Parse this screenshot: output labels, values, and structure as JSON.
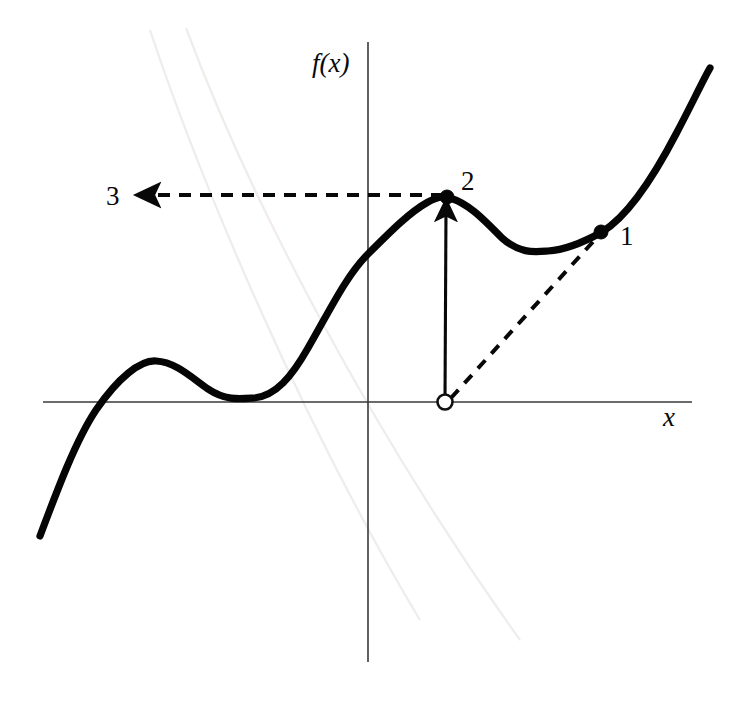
{
  "figure": {
    "background_color": "#ffffff",
    "curve_color": "#050505",
    "axis_color": "#3a3a3a",
    "label_color": "#0a0a0a"
  },
  "axes": {
    "y_axis_label": "f(x)",
    "x_axis_label": "x",
    "y_axis_label_pos": {
      "x": 312,
      "y": 72
    },
    "x_axis_label_pos": {
      "x": 663,
      "y": 426
    },
    "x_axis": {
      "x1": 43,
      "y1": 402,
      "x2": 692,
      "y2": 402
    },
    "y_axis": {
      "x1": 368,
      "y1": 42,
      "x2": 368,
      "y2": 662
    }
  },
  "labels": [
    {
      "id": "label-1",
      "text": "1",
      "x": 620,
      "y": 245
    },
    {
      "id": "label-2",
      "text": "2",
      "x": 461,
      "y": 190
    },
    {
      "id": "label-3",
      "text": "3",
      "x": 106,
      "y": 205
    }
  ],
  "markers": [
    {
      "id": "point-1",
      "kind": "filled",
      "x": 601,
      "y": 232,
      "r": 7.0
    },
    {
      "id": "point-2",
      "kind": "filled",
      "x": 447,
      "y": 197,
      "r": 7.0
    },
    {
      "id": "point-open",
      "kind": "open",
      "x": 445,
      "y": 402,
      "r": 7.5
    }
  ],
  "annotations": {
    "vertical_arrow": {
      "from_x": 445,
      "from_y": 401,
      "to_x": 446,
      "to_y": 205
    },
    "horizontal_dashed_arrow": {
      "from_x": 443,
      "from_y": 195,
      "to_x": 142,
      "to_y": 195
    },
    "diagonal_dashed_line": {
      "from_x": 451,
      "from_y": 398,
      "to_x": 600,
      "to_y": 234
    }
  },
  "chart_data": {
    "type": "line",
    "xlabel": "x",
    "ylabel": "f(x)",
    "grid": false,
    "legend": false,
    "origin_px": {
      "x": 368,
      "y": 402
    },
    "curve_path": "M 40,536 C 58,488 76,440 96,410 C 118,378 140,360 156,361 C 176,362 192,378 208,389 C 226,401 240,399 254,398 C 276,396 292,376 308,348 C 330,310 346,276 368,254 C 392,230 410,212 428,202 C 440,196 444,196 450,198 C 470,204 486,222 502,238 C 520,254 534,252 548,251 C 566,250 584,242 602,232 C 628,216 652,180 676,134 C 692,104 702,82 710,68",
    "features": [
      {
        "name": "left-tail-start",
        "x_px": 40,
        "y_px": 536
      },
      {
        "name": "x-intercept-left",
        "x_px": 96,
        "y_px": 402
      },
      {
        "name": "local-max-1",
        "x_px": 156,
        "y_px": 361
      },
      {
        "name": "local-min-1",
        "x_px": 254,
        "y_px": 398
      },
      {
        "name": "y-intercept",
        "x_px": 368,
        "y_px": 254
      },
      {
        "name": "local-max-2",
        "x_px": 447,
        "y_px": 197
      },
      {
        "name": "local-min-2",
        "x_px": 548,
        "y_px": 251
      },
      {
        "name": "point-1-tangency",
        "x_px": 602,
        "y_px": 232
      },
      {
        "name": "right-tail-end",
        "x_px": 710,
        "y_px": 68
      }
    ]
  }
}
